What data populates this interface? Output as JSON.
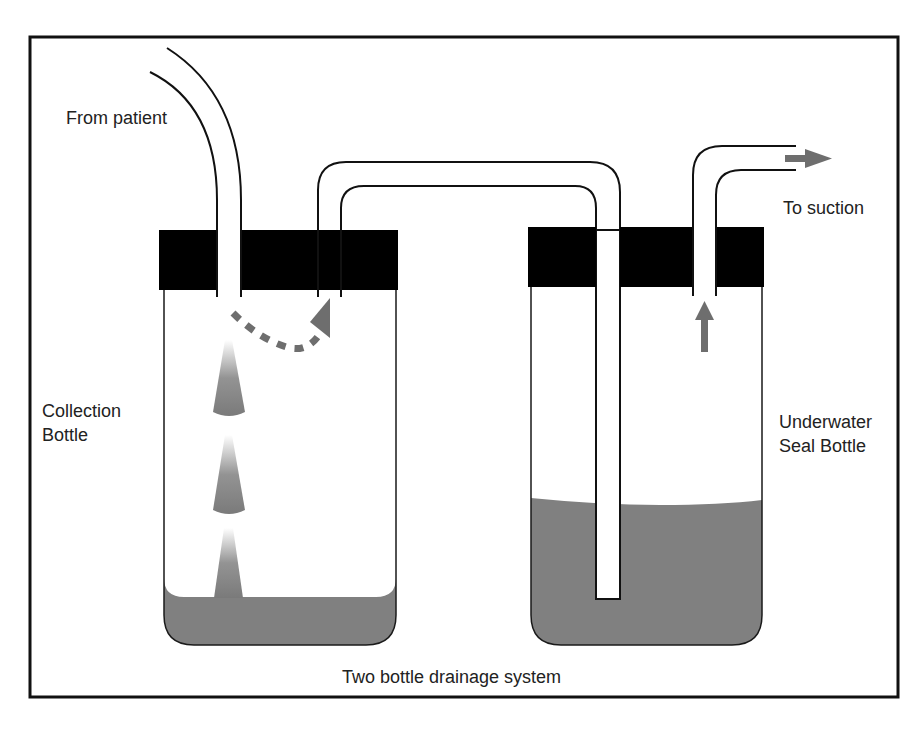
{
  "title": "Two bottle drainage system",
  "labels": {
    "from_patient": "From patient",
    "to_suction": "To suction",
    "collection_bottle_line1": "Collection",
    "collection_bottle_line2": "Bottle",
    "seal_bottle_line1": "Underwater",
    "seal_bottle_line2": "Seal Bottle"
  },
  "colors": {
    "fluid": "#808080",
    "cap": "#000000",
    "arrow": "#6e6e6e",
    "outline": "#1a1a1a"
  },
  "components": [
    {
      "name": "collection-bottle",
      "fluid_level": "low"
    },
    {
      "name": "underwater-seal-bottle",
      "fluid_level": "high"
    },
    {
      "name": "patient-tube"
    },
    {
      "name": "connecting-tube"
    },
    {
      "name": "suction-tube"
    }
  ]
}
